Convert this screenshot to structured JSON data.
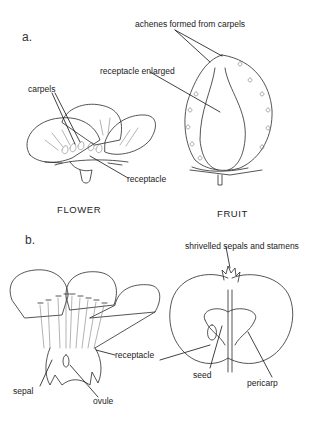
{
  "panels": {
    "a": {
      "label": "a.",
      "flower": {
        "caption": "FLOWER",
        "labels": {
          "carpels": "carpels",
          "receptacle": "receptacle"
        }
      },
      "fruit": {
        "caption": "FRUIT",
        "labels": {
          "achenes": "achenes formed from carpels",
          "receptacle_enlarged": "receptacle enlarged"
        }
      }
    },
    "b": {
      "label": "b.",
      "flower": {
        "labels": {
          "sepal": "sepal",
          "ovule": "ovule",
          "receptacle": "receptacle"
        }
      },
      "fruit": {
        "labels": {
          "shrivelled": "shrivelled sepals and stamens",
          "seed": "seed",
          "pericarp": "pericarp"
        }
      }
    }
  },
  "colors": {
    "ink": "#2a2a2a",
    "background": "#ffffff"
  }
}
